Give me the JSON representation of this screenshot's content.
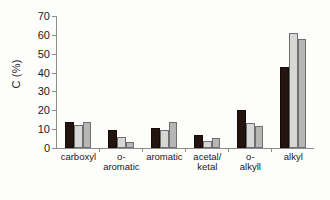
{
  "chart_data": {
    "type": "bar",
    "title": "",
    "xlabel": "",
    "ylabel": "C (%)",
    "ylim": [
      0,
      70
    ],
    "yticks": [
      0,
      10,
      20,
      30,
      40,
      50,
      60,
      70
    ],
    "ytick_labels": [
      "0",
      "10",
      "20",
      "30",
      "40",
      "50",
      "60",
      "70"
    ],
    "grid": false,
    "legend": "none",
    "categories": [
      "carboxyl",
      "o-aromatic",
      "aromatic",
      "acetal/\nketal",
      "o-alkyll",
      "alkyl"
    ],
    "series": [
      {
        "name": "series-1",
        "color": "#241410",
        "values": [
          13,
          8.5,
          9.5,
          6,
          19,
          42
        ]
      },
      {
        "name": "series-2",
        "color": "#d7d7d5",
        "values": [
          11,
          5,
          8.5,
          2.5,
          12,
          60
        ]
      },
      {
        "name": "series-3",
        "color": "#b6b6b4",
        "values": [
          13,
          2,
          13,
          4.5,
          10.5,
          57
        ]
      }
    ]
  },
  "axis": {
    "y_title": "C (%)"
  }
}
